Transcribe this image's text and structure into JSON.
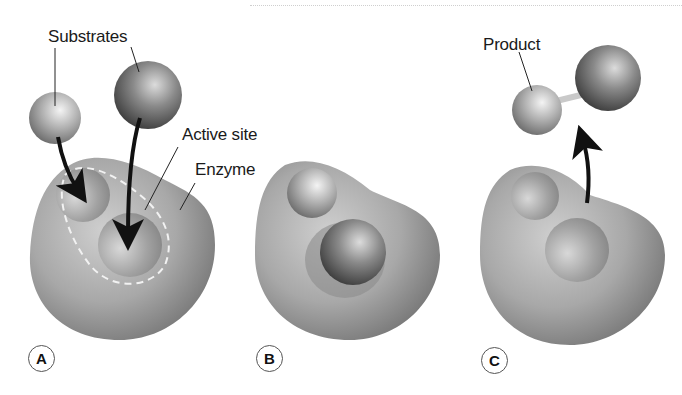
{
  "labels": {
    "substrates": "Substrates",
    "active_site": "Active site",
    "enzyme": "Enzyme",
    "product": "Product"
  },
  "panels": [
    {
      "id": "A",
      "description": "Substrates approach the active site of the enzyme"
    },
    {
      "id": "B",
      "description": "Substrates bound in the active site"
    },
    {
      "id": "C",
      "description": "Product released from the enzyme"
    }
  ],
  "colors": {
    "enzyme_light": "#c4c4c4",
    "enzyme_dark": "#7a7a7a",
    "small_sphere_light": "#e8e8e8",
    "small_sphere_dark": "#6f6f6f",
    "large_sphere_light": "#d0d0d0",
    "large_sphere_dark": "#3e3e3e",
    "arrow": "#111111",
    "dashed_outline": "#f2f2f2"
  }
}
